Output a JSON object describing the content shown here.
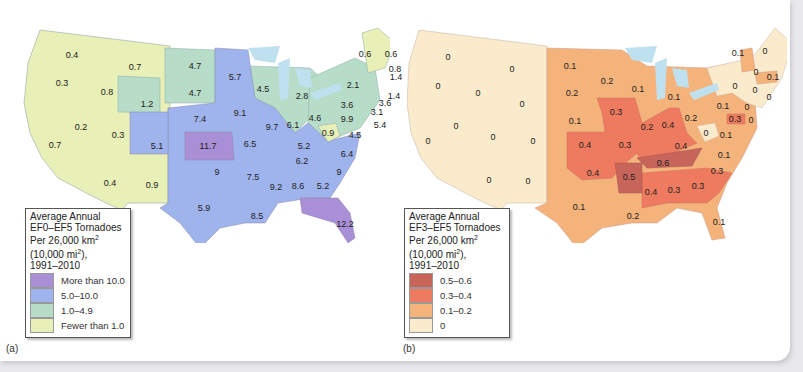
{
  "figure": {
    "panels": [
      {
        "id": "a",
        "caption": "(a)",
        "legend": {
          "title_line1": "Average Annual",
          "title_line2": "EF0–EF5 Tornadoes",
          "title_line3": "Per 26,000 km",
          "title_line4": "(10,000 mi",
          "title_line4_end": "),",
          "title_line5": "1991–2010",
          "sup": "2",
          "items": [
            {
              "label": "More than 10.0",
              "color": "#a98fd6"
            },
            {
              "label": "5.0–10.0",
              "color": "#9fb3ec"
            },
            {
              "label": "1.0–4.9",
              "color": "#b7dcc8"
            },
            {
              "label": "Fewer than 1.0",
              "color": "#e8efb7"
            }
          ]
        },
        "regions": [
          {
            "name": "Washington",
            "value": "0.4",
            "x": 62,
            "y": 47
          },
          {
            "name": "Montana",
            "value": "0.7",
            "x": 125,
            "y": 59
          },
          {
            "name": "Oregon",
            "value": "0.3",
            "x": 52,
            "y": 75
          },
          {
            "name": "Idaho",
            "value": "0.8",
            "x": 97,
            "y": 84
          },
          {
            "name": "Wyoming",
            "value": "1.2",
            "x": 137,
            "y": 96
          },
          {
            "name": "North Dakota",
            "value": "4.7",
            "x": 185,
            "y": 58
          },
          {
            "name": "South Dakota",
            "value": "4.7",
            "x": 185,
            "y": 85
          },
          {
            "name": "Minnesota",
            "value": "5.7",
            "x": 225,
            "y": 69
          },
          {
            "name": "Wisconsin",
            "value": "4.5",
            "x": 253,
            "y": 81
          },
          {
            "name": "Michigan",
            "value": "2.8",
            "x": 292,
            "y": 88
          },
          {
            "name": "New York",
            "value": "2.1",
            "x": 343,
            "y": 77
          },
          {
            "name": "Vermont/NH",
            "value": "0.6",
            "x": 355,
            "y": 46
          },
          {
            "name": "Maine",
            "value": "0.6",
            "x": 381,
            "y": 46
          },
          {
            "name": "New Hampshire",
            "value": "0.8",
            "x": 385,
            "y": 61
          },
          {
            "name": "Massachusetts",
            "value": "1.4",
            "x": 386,
            "y": 69
          },
          {
            "name": "Rhode Island",
            "value": "1.4",
            "x": 384,
            "y": 88
          },
          {
            "name": "Connecticut",
            "value": "3.6",
            "x": 375,
            "y": 95
          },
          {
            "name": "Pennsylvania",
            "value": "3.6",
            "x": 337,
            "y": 97
          },
          {
            "name": "New Jersey",
            "value": "3.1",
            "x": 367,
            "y": 104
          },
          {
            "name": "Maryland",
            "value": "9.9",
            "x": 337,
            "y": 111
          },
          {
            "name": "Delaware",
            "value": "5.4",
            "x": 370,
            "y": 117
          },
          {
            "name": "Ohio",
            "value": "4.6",
            "x": 305,
            "y": 110
          },
          {
            "name": "West Virginia",
            "value": "0.9",
            "x": 318,
            "y": 125
          },
          {
            "name": "Virginia",
            "value": "4.5",
            "x": 345,
            "y": 127
          },
          {
            "name": "Nebraska",
            "value": "7.4",
            "x": 190,
            "y": 111
          },
          {
            "name": "Iowa",
            "value": "9.1",
            "x": 230,
            "y": 105
          },
          {
            "name": "Illinois",
            "value": "9.7",
            "x": 262,
            "y": 119
          },
          {
            "name": "Indiana",
            "value": "6.1",
            "x": 283,
            "y": 117
          },
          {
            "name": "California",
            "value": "0.7",
            "x": 45,
            "y": 137
          },
          {
            "name": "Nevada",
            "value": "0.2",
            "x": 71,
            "y": 119
          },
          {
            "name": "Utah",
            "value": "0.3",
            "x": 108,
            "y": 127
          },
          {
            "name": "Colorado",
            "value": "5.1",
            "x": 147,
            "y": 138
          },
          {
            "name": "Kansas",
            "value": "11.7",
            "x": 198,
            "y": 138
          },
          {
            "name": "Missouri",
            "value": "6.5",
            "x": 240,
            "y": 136
          },
          {
            "name": "Kentucky",
            "value": "5.2",
            "x": 294,
            "y": 138
          },
          {
            "name": "North Carolina",
            "value": "6.4",
            "x": 337,
            "y": 146
          },
          {
            "name": "Tennessee",
            "value": "6.2",
            "x": 292,
            "y": 153
          },
          {
            "name": "Arizona",
            "value": "0.4",
            "x": 100,
            "y": 175
          },
          {
            "name": "New Mexico",
            "value": "0.9",
            "x": 142,
            "y": 177
          },
          {
            "name": "Oklahoma",
            "value": "9",
            "x": 207,
            "y": 164
          },
          {
            "name": "Arkansas",
            "value": "7.5",
            "x": 243,
            "y": 169
          },
          {
            "name": "South Carolina",
            "value": "9",
            "x": 329,
            "y": 164
          },
          {
            "name": "Mississippi",
            "value": "9.2",
            "x": 266,
            "y": 179
          },
          {
            "name": "Alabama",
            "value": "8.6",
            "x": 288,
            "y": 178
          },
          {
            "name": "Georgia",
            "value": "5.2",
            "x": 313,
            "y": 178
          },
          {
            "name": "Texas",
            "value": "5.9",
            "x": 194,
            "y": 200
          },
          {
            "name": "Louisiana",
            "value": "8.5",
            "x": 247,
            "y": 208
          },
          {
            "name": "Florida",
            "value": "12.2",
            "x": 335,
            "y": 216
          }
        ]
      },
      {
        "id": "b",
        "caption": "(b)",
        "legend": {
          "title_line1": "Average Annual",
          "title_line2": "EF3–EF5 Tornadoes",
          "title_line3": "Per 26,000 km",
          "title_line4": "(10,000 mi",
          "title_line4_end": "),",
          "title_line5": "1991–2010",
          "sup": "2",
          "items": [
            {
              "label": "0.5–0.6",
              "color": "#c8655a"
            },
            {
              "label": "0.3–0.4",
              "color": "#ee7a5f"
            },
            {
              "label": "0.1–0.2",
              "color": "#f4b37a"
            },
            {
              "label": "0",
              "color": "#faebcc"
            }
          ]
        },
        "regions": [
          {
            "name": "Washington",
            "value": "0",
            "x": 41,
            "y": 49
          },
          {
            "name": "Montana",
            "value": "0",
            "x": 105,
            "y": 61
          },
          {
            "name": "Oregon",
            "value": "0",
            "x": 31,
            "y": 78
          },
          {
            "name": "Idaho",
            "value": "0",
            "x": 71,
            "y": 85
          },
          {
            "name": "Wyoming",
            "value": "0",
            "x": 115,
            "y": 96
          },
          {
            "name": "North Dakota",
            "value": "0.1",
            "x": 163,
            "y": 58
          },
          {
            "name": "South Dakota",
            "value": "0.2",
            "x": 165,
            "y": 85
          },
          {
            "name": "Minnesota",
            "value": "0.2",
            "x": 200,
            "y": 73
          },
          {
            "name": "Wisconsin",
            "value": "0.1",
            "x": 231,
            "y": 81
          },
          {
            "name": "Michigan",
            "value": "0.1",
            "x": 267,
            "y": 89
          },
          {
            "name": "Nebraska",
            "value": "0.1",
            "x": 168,
            "y": 113
          },
          {
            "name": "Iowa",
            "value": "0.3",
            "x": 209,
            "y": 104
          },
          {
            "name": "Illinois",
            "value": "0.2",
            "x": 240,
            "y": 119
          },
          {
            "name": "Indiana",
            "value": "0.4",
            "x": 261,
            "y": 117
          },
          {
            "name": "Ohio",
            "value": "0.2",
            "x": 284,
            "y": 110
          },
          {
            "name": "Pennsylvania",
            "value": "0.1",
            "x": 316,
            "y": 98
          },
          {
            "name": "New York",
            "value": "0",
            "x": 328,
            "y": 78
          },
          {
            "name": "Vermont",
            "value": "0.1",
            "x": 331,
            "y": 45
          },
          {
            "name": "Maine",
            "value": "0",
            "x": 358,
            "y": 43
          },
          {
            "name": "New Hampshire",
            "value": "0",
            "x": 349,
            "y": 64
          },
          {
            "name": "Massachusetts",
            "value": "0.1",
            "x": 366,
            "y": 69
          },
          {
            "name": "Connecticut",
            "value": "0",
            "x": 348,
            "y": 82
          },
          {
            "name": "Rhode Island",
            "value": "0",
            "x": 362,
            "y": 89
          },
          {
            "name": "New Jersey",
            "value": "0",
            "x": 340,
            "y": 99
          },
          {
            "name": "Maryland",
            "value": "0.3",
            "x": 328,
            "y": 111
          },
          {
            "name": "Delaware",
            "value": "0",
            "x": 344,
            "y": 112
          },
          {
            "name": "West Virginia",
            "value": "0",
            "x": 299,
            "y": 125
          },
          {
            "name": "Virginia",
            "value": "0.1",
            "x": 319,
            "y": 127
          },
          {
            "name": "California",
            "value": "0",
            "x": 21,
            "y": 133
          },
          {
            "name": "Nevada",
            "value": "0",
            "x": 49,
            "y": 118
          },
          {
            "name": "Utah",
            "value": "0",
            "x": 86,
            "y": 129
          },
          {
            "name": "Colorado",
            "value": "0",
            "x": 126,
            "y": 133
          },
          {
            "name": "Kansas",
            "value": "0.4",
            "x": 178,
            "y": 137
          },
          {
            "name": "Missouri",
            "value": "0.3",
            "x": 218,
            "y": 137
          },
          {
            "name": "Kentucky",
            "value": "0.4",
            "x": 274,
            "y": 138
          },
          {
            "name": "North Carolina",
            "value": "0.1",
            "x": 317,
            "y": 147
          },
          {
            "name": "Tennessee",
            "value": "0.6",
            "x": 256,
            "y": 155
          },
          {
            "name": "Arizona",
            "value": "0",
            "x": 82,
            "y": 172
          },
          {
            "name": "New Mexico",
            "value": "0",
            "x": 121,
            "y": 173
          },
          {
            "name": "Oklahoma",
            "value": "0.4",
            "x": 186,
            "y": 165
          },
          {
            "name": "Arkansas",
            "value": "0.5",
            "x": 222,
            "y": 169
          },
          {
            "name": "South Carolina",
            "value": "0.3",
            "x": 310,
            "y": 163
          },
          {
            "name": "Mississippi",
            "value": "0.4",
            "x": 244,
            "y": 184
          },
          {
            "name": "Alabama",
            "value": "0.3",
            "x": 267,
            "y": 182
          },
          {
            "name": "Georgia",
            "value": "0.3",
            "x": 291,
            "y": 178
          },
          {
            "name": "Texas",
            "value": "0.1",
            "x": 172,
            "y": 199
          },
          {
            "name": "Louisiana",
            "value": "0.2",
            "x": 226,
            "y": 208
          },
          {
            "name": "Florida",
            "value": "0.1",
            "x": 312,
            "y": 214
          }
        ]
      }
    ],
    "colors": {
      "water": "#bfe0ef",
      "frame_bg": "#ffffff",
      "page_bg": "#e9e9ec"
    }
  }
}
